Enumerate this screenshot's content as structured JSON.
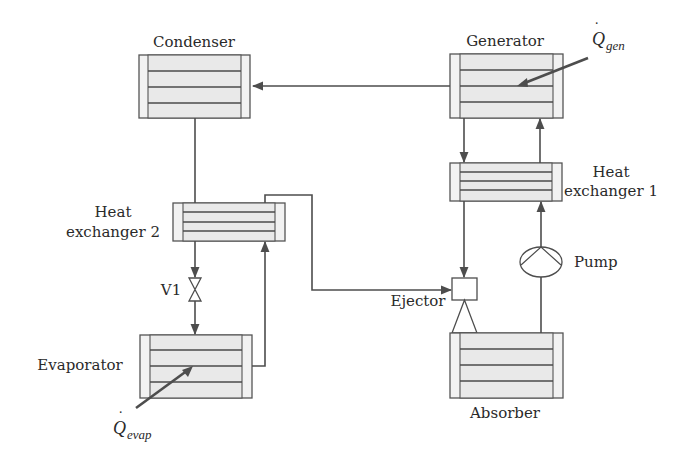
{
  "diagram": {
    "type": "ejector-absorption refrigeration cycle schematic",
    "colors": {
      "line": "#4d4d4d",
      "box_fill": "#eeeeee",
      "text": "#2a2a2a"
    },
    "components": {
      "condenser": {
        "label": "Condenser"
      },
      "generator": {
        "label": "Generator"
      },
      "heat_exchanger_1": {
        "label_line1": "Heat",
        "label_line2": "exchanger 1"
      },
      "heat_exchanger_2": {
        "label_line1": "Heat",
        "label_line2": "exchanger 2"
      },
      "valve": {
        "label": "V1"
      },
      "evaporator": {
        "label": "Evaporator"
      },
      "ejector": {
        "label": "Ejector"
      },
      "pump": {
        "label": "Pump"
      },
      "absorber": {
        "label": "Absorber"
      }
    },
    "heat_flows": {
      "generator": {
        "symbol": "Q",
        "dot": "˙",
        "subscript": "gen"
      },
      "evaporator": {
        "symbol": "Q",
        "dot": "˙",
        "subscript": "evap"
      }
    },
    "connections": [
      {
        "from": "Generator",
        "to": "Condenser"
      },
      {
        "from": "Condenser",
        "to": "Heat exchanger 2"
      },
      {
        "from": "Heat exchanger 2",
        "to": "V1"
      },
      {
        "from": "V1",
        "to": "Evaporator"
      },
      {
        "from": "Evaporator",
        "to": "Heat exchanger 2"
      },
      {
        "from": "Heat exchanger 2",
        "to": "Ejector"
      },
      {
        "from": "Generator",
        "to": "Heat exchanger 1"
      },
      {
        "from": "Heat exchanger 1",
        "to": "Ejector"
      },
      {
        "from": "Ejector",
        "to": "Absorber"
      },
      {
        "from": "Absorber",
        "to": "Pump"
      },
      {
        "from": "Pump",
        "to": "Heat exchanger 1"
      },
      {
        "from": "Heat exchanger 1",
        "to": "Generator"
      }
    ]
  }
}
